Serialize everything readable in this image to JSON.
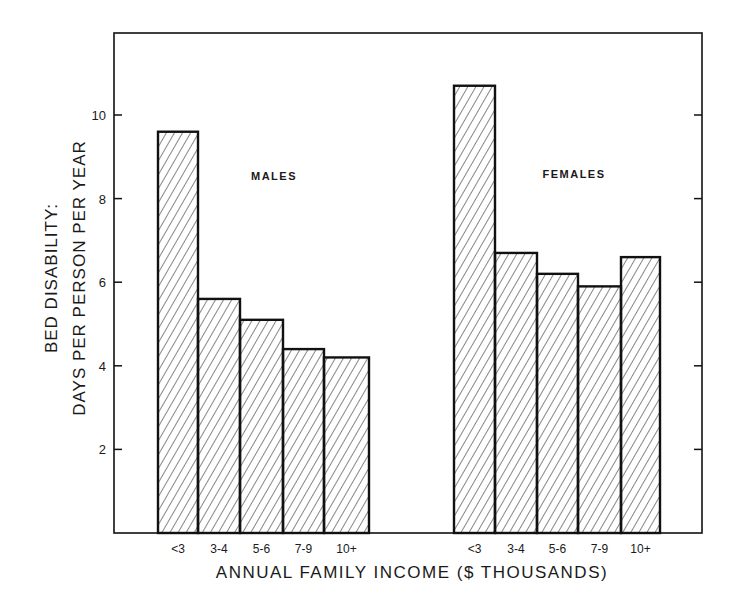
{
  "chart_data": {
    "type": "bar",
    "title": "",
    "xlabel": "ANNUAL FAMILY INCOME ($ THOUSANDS)",
    "ylabel_line1": "BED DISABILITY:",
    "ylabel_line2": "DAYS PER PERSON PER YEAR",
    "ylim": [
      0,
      11.5
    ],
    "yticks": [
      2,
      4,
      6,
      8,
      10
    ],
    "grid": false,
    "categories": [
      "<3",
      "3-4",
      "5-6",
      "7-9",
      "10+"
    ],
    "groups": [
      {
        "name": "MALES",
        "values": [
          9.6,
          5.6,
          5.1,
          4.4,
          4.2
        ]
      },
      {
        "name": "FEMALES",
        "values": [
          10.7,
          6.7,
          6.2,
          5.9,
          6.6
        ]
      }
    ],
    "fill": "diagonal-hatch",
    "colors": {
      "stroke": "#111111",
      "hatch": "#222222",
      "background": "#ffffff"
    }
  }
}
